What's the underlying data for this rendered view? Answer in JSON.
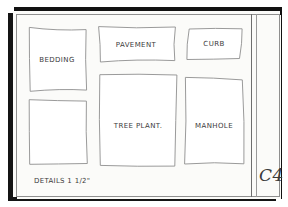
{
  "sheet": {
    "caption": "DETAILS 1 1/2\"",
    "sheet_number": "C4",
    "paper_color": "#fbfbf9",
    "line_color": "#8f8f8f",
    "ink_color": "#3b3b3b",
    "frame_color": "#111111"
  },
  "details": [
    {
      "id": "bedding",
      "label": "BEDDING",
      "x": 29,
      "y": 28,
      "w": 57,
      "h": 62,
      "label_x": 57,
      "label_y": 60
    },
    {
      "id": "pavement",
      "label": "PAVEMENT",
      "x": 100,
      "y": 26,
      "w": 74,
      "h": 36,
      "label_x": 136,
      "label_y": 45
    },
    {
      "id": "curb",
      "label": "CURB",
      "x": 188,
      "y": 28,
      "w": 53,
      "h": 31,
      "label_x": 214,
      "label_y": 44
    },
    {
      "id": "unlabeled",
      "label": "",
      "x": 29,
      "y": 100,
      "w": 58,
      "h": 64,
      "label_x": 58,
      "label_y": 132
    },
    {
      "id": "tree-plant",
      "label": "TREE PLANT.",
      "x": 100,
      "y": 76,
      "w": 76,
      "h": 89,
      "label_x": 138,
      "label_y": 126
    },
    {
      "id": "manhole",
      "label": "MANHOLE",
      "x": 185,
      "y": 79,
      "w": 58,
      "h": 85,
      "label_x": 214,
      "label_y": 126
    }
  ],
  "caption_pos": {
    "x": 34,
    "y": 177
  },
  "sheet_number_pos": {
    "x": 259,
    "y": 165
  }
}
